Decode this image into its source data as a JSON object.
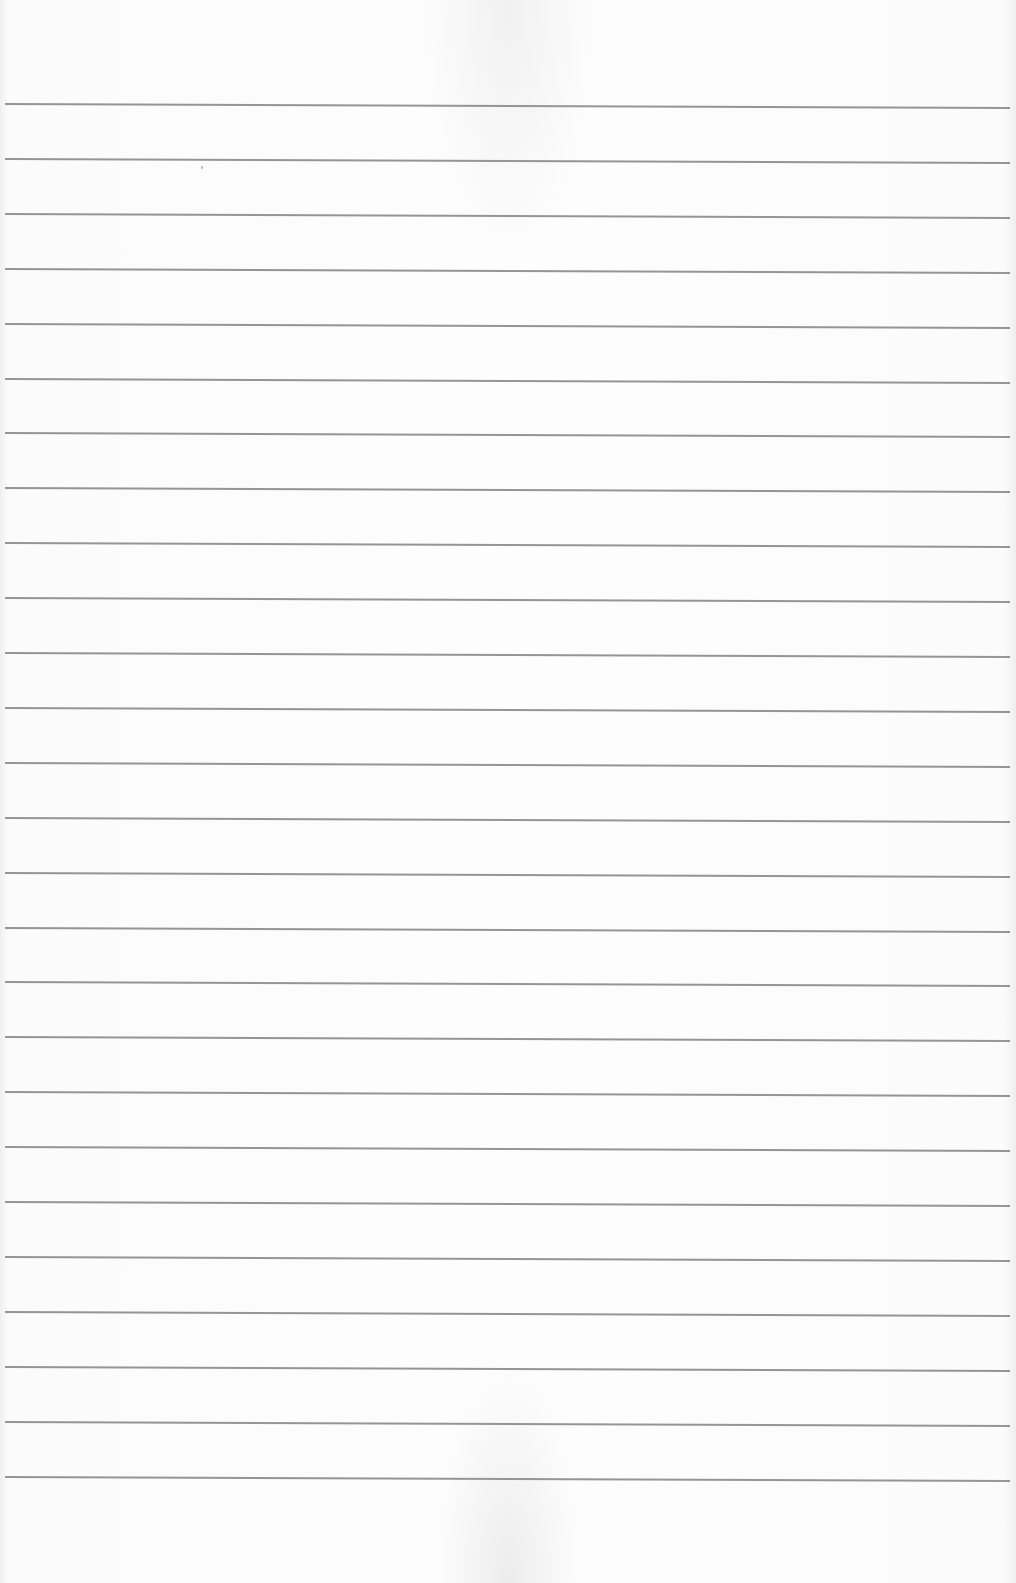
{
  "document": {
    "type": "lined paper",
    "text_content": "",
    "line_count": 26,
    "first_line_y": 103,
    "line_spacing_px": 54.9,
    "line_color": "#8c8c8c",
    "paper_color": "#fcfcfc"
  }
}
